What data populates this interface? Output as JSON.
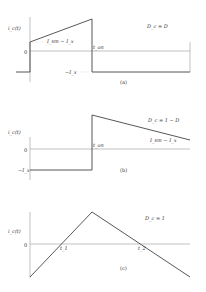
{
  "panels": [
    {
      "caption": "(a)",
      "y_label": "i_c(t)",
      "zero_label": "0",
      "condition": "D_c = D",
      "labels": {
        "level1": "I_sm − I_x",
        "neg": "−I_x",
        "t_on": "t_on"
      }
    },
    {
      "caption": "(b)",
      "y_label": "i_c(t)",
      "zero_label": "0",
      "condition": "D_c = 1 − D",
      "labels": {
        "neg": "−I_x",
        "t_on": "t_on",
        "level1": "I_sm − I_x"
      }
    },
    {
      "caption": "(c)",
      "y_label": "i_c(t)",
      "zero_label": "0",
      "condition": "D_c = 1",
      "labels": {
        "t1": "t_1",
        "t2": "t_2"
      }
    }
  ]
}
